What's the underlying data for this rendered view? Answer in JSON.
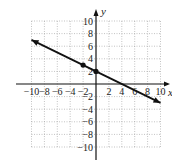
{
  "figure_label": "",
  "chart_data": {
    "type": "line",
    "title": "",
    "xlabel": "x",
    "ylabel": "y",
    "xlim": [
      -10,
      10
    ],
    "ylim": [
      -10,
      10
    ],
    "grid": true,
    "x_ticks": [
      -10,
      -8,
      -6,
      -4,
      -2,
      2,
      4,
      6,
      8,
      10
    ],
    "y_ticks": [
      -10,
      -8,
      -6,
      -4,
      -2,
      2,
      4,
      6,
      8,
      10
    ],
    "x_tick_labels": [
      "-10",
      "-8",
      "-6",
      "-4",
      "-2",
      "2",
      "4",
      "6",
      "8",
      "10"
    ],
    "y_tick_labels": [
      "-10",
      "-8",
      "-6",
      "-4",
      "-2",
      "2",
      "4",
      "6",
      "8",
      "10"
    ],
    "series": [
      {
        "name": "line",
        "equation": "y = -1/2 x + 2",
        "x": [
          -10,
          10
        ],
        "y": [
          7,
          -3
        ],
        "arrows": "both"
      }
    ],
    "points": [
      {
        "x": -2,
        "y": 3
      },
      {
        "x": 0,
        "y": 2
      }
    ],
    "colors": {
      "line": "#111111",
      "grid": "#9a9a9a",
      "axis": "#111111"
    }
  }
}
